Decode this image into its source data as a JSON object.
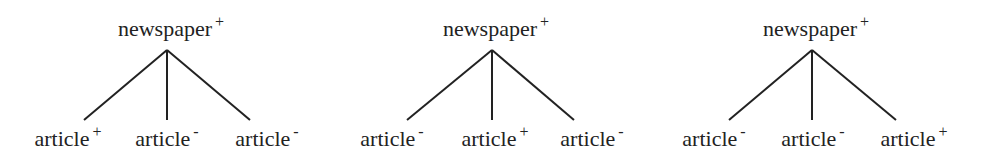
{
  "diagram": {
    "type": "tree-set",
    "trees": [
      {
        "root": {
          "label": "newspaper",
          "sign": "+"
        },
        "children": [
          {
            "label": "article",
            "sign": "+"
          },
          {
            "label": "article",
            "sign": "-"
          },
          {
            "label": "article",
            "sign": "-"
          }
        ]
      },
      {
        "root": {
          "label": "newspaper",
          "sign": "+"
        },
        "children": [
          {
            "label": "article",
            "sign": "-"
          },
          {
            "label": "article",
            "sign": "+"
          },
          {
            "label": "article",
            "sign": "-"
          }
        ]
      },
      {
        "root": {
          "label": "newspaper",
          "sign": "+"
        },
        "children": [
          {
            "label": "article",
            "sign": "-"
          },
          {
            "label": "article",
            "sign": "-"
          },
          {
            "label": "article",
            "sign": "+"
          }
        ]
      }
    ]
  }
}
